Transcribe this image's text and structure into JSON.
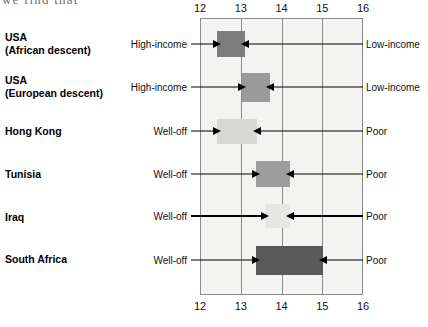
{
  "page": {
    "clipped_header_text": "we find that"
  },
  "chart_data": {
    "type": "bar",
    "orientation": "horizontal-range",
    "title": "",
    "xlabel": "",
    "ylabel": "",
    "xlim": [
      11.8,
      16.2
    ],
    "axis_top_ticks": [
      "12",
      "13",
      "14",
      "15",
      "16"
    ],
    "axis_bottom_ticks": [
      "12",
      "13",
      "14",
      "15",
      "16"
    ],
    "gridlines": [
      12,
      13,
      14,
      15,
      16
    ],
    "grid": true,
    "legend": "none",
    "plot_background": "#f3f3f1",
    "frame_color": "#8b8b8b",
    "categories": [
      "USA (African descent)",
      "USA (European descent)",
      "Hong Kong",
      "Tunisia",
      "Iraq",
      "South Africa"
    ],
    "bars": [
      {
        "category": "USA",
        "category_line1": "USA",
        "category_line2": "(African descent)",
        "x_start": 12.42,
        "x_end": 13.1,
        "color": "#7d7d7d",
        "left_label": "High-income",
        "right_label": "Low-income"
      },
      {
        "category": "USA (European descent)",
        "category_line1": "USA",
        "category_line2": "(European descent)",
        "x_start": 13.02,
        "x_end": 13.72,
        "color": "#9a9a9a",
        "left_label": "High-income",
        "right_label": "Low-income"
      },
      {
        "category": "Hong Kong",
        "category_line1": "Hong Kong",
        "category_line2": "",
        "x_start": 12.42,
        "x_end": 13.41,
        "color": "#d8d8d6",
        "left_label": "Well-off",
        "right_label": "Poor"
      },
      {
        "category": "Tunisia",
        "category_line1": "Tunisia",
        "category_line2": "",
        "x_start": 13.38,
        "x_end": 14.21,
        "color": "#9d9d9d",
        "left_label": "Well-off",
        "right_label": "Poor"
      },
      {
        "category": "Iraq",
        "category_line1": "Iraq",
        "category_line2": "",
        "x_start": 13.6,
        "x_end": 14.22,
        "color": "#e6e6e4",
        "left_label": "Well-off",
        "right_label": "Poor"
      },
      {
        "category": "South Africa",
        "category_line1": "South Africa",
        "category_line2": "",
        "x_start": 13.38,
        "x_end": 15.02,
        "color": "#595959",
        "left_label": "Well-off",
        "right_label": "Poor"
      }
    ]
  }
}
